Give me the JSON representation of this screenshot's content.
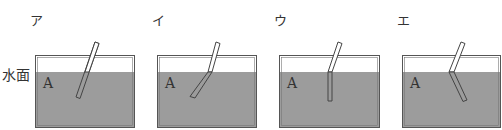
{
  "side_label": "水面",
  "panels": [
    {
      "label": "ア",
      "substance": "A",
      "rod_shape": "straight"
    },
    {
      "label": "イ",
      "substance": "A",
      "rod_shape": "bent-toward-horizontal"
    },
    {
      "label": "ウ",
      "substance": "A",
      "rod_shape": "bent-vertical"
    },
    {
      "label": "エ",
      "substance": "A",
      "rod_shape": "bent-reverse"
    }
  ],
  "colors": {
    "water": "#9c9c9c",
    "outline": "#555555",
    "rod_fill": "#ffffff"
  }
}
